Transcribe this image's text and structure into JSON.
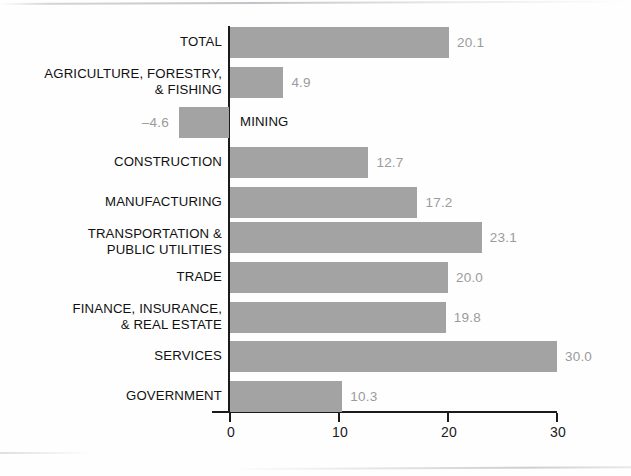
{
  "chart_data": {
    "type": "bar",
    "orientation": "horizontal",
    "title": "",
    "subtitle": "",
    "xlabel": "",
    "ylabel": "",
    "xlim": [
      -4.6,
      30
    ],
    "axis_ticks": [
      "0",
      "10",
      "20",
      "30"
    ],
    "axis_tick_values": [
      0,
      10,
      20,
      30
    ],
    "grid": false,
    "legend": false,
    "bar_color": "#a3a3a3",
    "value_label_color": "#9b9b9b",
    "category_label_color": "#111111",
    "axis_color": "#1b1b1b",
    "categories": [
      "TOTAL",
      "AGRICULTURE, FORESTRY,\n& FISHING",
      "MINING",
      "CONSTRUCTION",
      "MANUFACTURING",
      "TRANSPORTATION &\nPUBLIC UTILITIES",
      "TRADE",
      "FINANCE, INSURANCE,\n& REAL ESTATE",
      "SERVICES",
      "GOVERNMENT"
    ],
    "values": [
      20.1,
      4.9,
      -4.6,
      12.7,
      17.2,
      23.1,
      20.0,
      19.8,
      30.0,
      10.3
    ],
    "value_labels": [
      "20.1",
      "4.9",
      "–4.6",
      "12.7",
      "17.2",
      "23.1",
      "20.0",
      "19.8",
      "30.0",
      "10.3"
    ]
  },
  "rows": [
    {
      "label": "TOTAL",
      "value_label": "20.1",
      "value": 20.1,
      "top": 27,
      "height": 31,
      "label_top": 34,
      "label_inside": false
    },
    {
      "label": "AGRICULTURE, FORESTRY,\n& FISHING",
      "value_label": "4.9",
      "value": 4.9,
      "top": 67,
      "height": 31,
      "label_top": 66,
      "label_inside": false
    },
    {
      "label": "MINING",
      "value_label": "–4.6",
      "value": -4.6,
      "top": 107,
      "height": 31,
      "label_top": 114,
      "label_inside": true
    },
    {
      "label": "CONSTRUCTION",
      "value_label": "12.7",
      "value": 12.7,
      "top": 147,
      "height": 31,
      "label_top": 154,
      "label_inside": false
    },
    {
      "label": "MANUFACTURING",
      "value_label": "17.2",
      "value": 17.2,
      "top": 187,
      "height": 31,
      "label_top": 194,
      "label_inside": false
    },
    {
      "label": "TRANSPORTATION &\nPUBLIC UTILITIES",
      "value_label": "23.1",
      "value": 23.1,
      "top": 222,
      "height": 31,
      "label_top": 226,
      "label_inside": false
    },
    {
      "label": "TRADE",
      "value_label": "20.0",
      "value": 20.0,
      "top": 262,
      "height": 31,
      "label_top": 269,
      "label_inside": false
    },
    {
      "label": "FINANCE, INSURANCE,\n& REAL ESTATE",
      "value_label": "19.8",
      "value": 19.8,
      "top": 302,
      "height": 31,
      "label_top": 301,
      "label_inside": false
    },
    {
      "label": "SERVICES",
      "value_label": "30.0",
      "value": 30.0,
      "top": 341,
      "height": 31,
      "label_top": 348,
      "label_inside": false
    },
    {
      "label": "GOVERNMENT",
      "value_label": "10.3",
      "value": 10.3,
      "top": 381,
      "height": 31,
      "label_top": 388,
      "label_inside": false
    }
  ],
  "axis": {
    "ticks": [
      {
        "label": "0",
        "value": 0
      },
      {
        "label": "10",
        "value": 10
      },
      {
        "label": "20",
        "value": 20
      },
      {
        "label": "30",
        "value": 30
      }
    ]
  },
  "geometry": {
    "zero_x": 229,
    "px_per_unit": 10.9,
    "axis_y": 411,
    "axis_left": 212,
    "axis_right": 557
  }
}
